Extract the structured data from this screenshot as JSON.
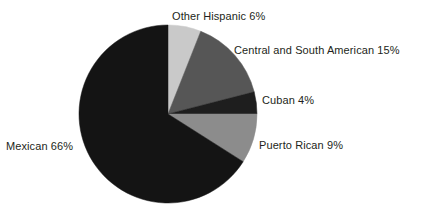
{
  "figure": {
    "background_color": "#ffffff",
    "text_color": "#231f20"
  },
  "chart_data": {
    "type": "pie",
    "title": "",
    "subtitle": "",
    "xlabel": "",
    "ylabel": "",
    "legend_position": "none",
    "labels_position": "outside-callout",
    "grid": false,
    "start_angle_deg": 0,
    "direction": "clockwise",
    "center": {
      "x": 168,
      "y": 114
    },
    "radius": 89,
    "unit": "percent",
    "total": 100,
    "categories": [
      "Other Hispanic",
      "Central and South American",
      "Cuban",
      "Puerto Rican",
      "Mexican"
    ],
    "values": [
      6,
      15,
      4,
      9,
      66
    ],
    "colors": [
      "#c9c9c9",
      "#565656",
      "#1e1e1e",
      "#8c8c8c",
      "#141414"
    ],
    "slices": [
      {
        "name": "Other Hispanic",
        "value": 6,
        "value_text": "6%",
        "label": "Other Hispanic 6%",
        "color": "#c9c9c9",
        "start_angle_deg": 0,
        "end_angle_deg": 21.6
      },
      {
        "name": "Central and South American",
        "value": 15,
        "value_text": "15%",
        "label": "Central and South American 15%",
        "color": "#565656",
        "start_angle_deg": 21.6,
        "end_angle_deg": 75.6
      },
      {
        "name": "Cuban",
        "value": 4,
        "value_text": "4%",
        "label": "Cuban 4%",
        "color": "#1e1e1e",
        "start_angle_deg": 75.6,
        "end_angle_deg": 90.0
      },
      {
        "name": "Puerto Rican",
        "value": 9,
        "value_text": "9%",
        "label": "Puerto Rican 9%",
        "color": "#8c8c8c",
        "start_angle_deg": 90.0,
        "end_angle_deg": 122.4
      },
      {
        "name": "Mexican",
        "value": 66,
        "value_text": "66%",
        "label": "Mexican 66%",
        "color": "#141414",
        "start_angle_deg": 122.4,
        "end_angle_deg": 360.0
      }
    ]
  }
}
